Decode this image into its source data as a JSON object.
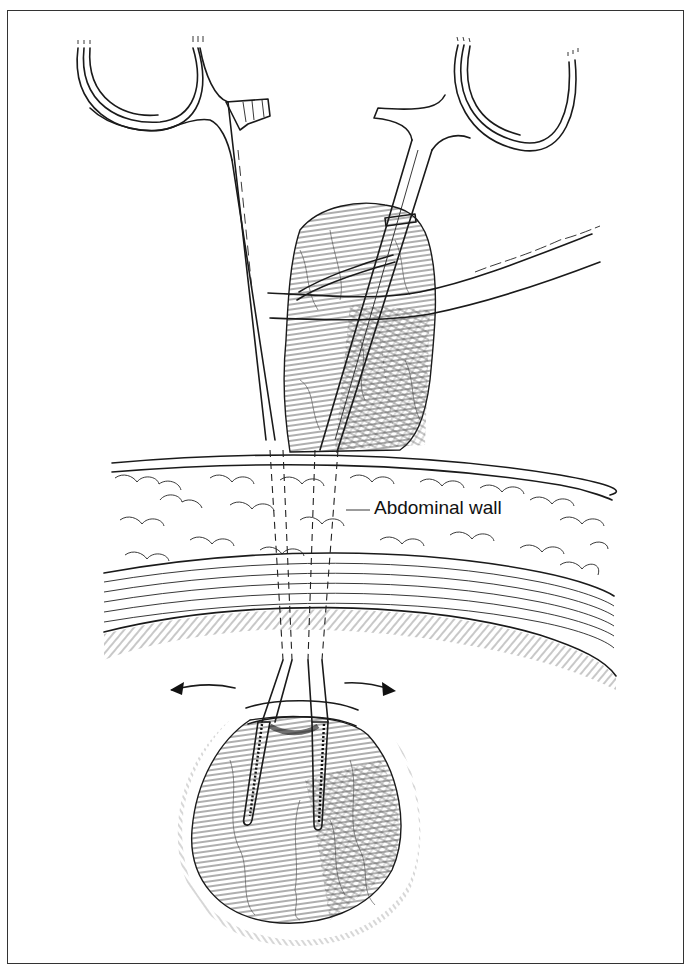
{
  "figure": {
    "label": "Abdominal wall",
    "arrows": [
      "left-arrow",
      "right-arrow"
    ],
    "colors": {
      "ink": "#1a1a1a",
      "background": "#ffffff",
      "frame": "#333333"
    }
  }
}
